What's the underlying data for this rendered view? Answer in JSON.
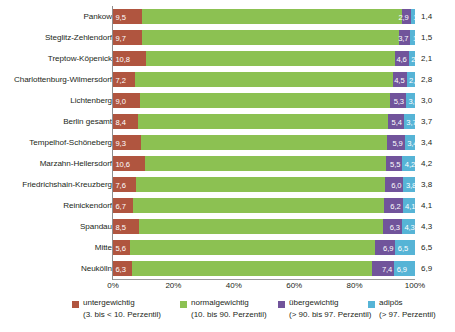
{
  "chart_data": {
    "type": "bar",
    "orientation": "horizontal",
    "stacked": true,
    "stack_mode": "percent",
    "title": "",
    "subtitle": "",
    "xlabel": "",
    "ylabel": "",
    "xlim": [
      0,
      100
    ],
    "grid": false,
    "legend_position": "bottom",
    "xticklabels": [
      "0%",
      "20%",
      "40%",
      "60%",
      "80%",
      "100%"
    ],
    "xtickvalues": [
      0,
      20,
      40,
      60,
      80,
      100
    ],
    "categories": [
      "Pankow",
      "Steglitz-Zehlendorf",
      "Treptow-Köpenick",
      "Charlottenburg-Wilmersdorf",
      "Lichtenberg",
      "Berlin gesamt",
      "Tempelhof-Schöneberg",
      "Marzahn-Hellersdorf",
      "Friedrichshain-Kreuzberg",
      "Reinickendorf",
      "Spandau",
      "Mitte",
      "Neukölln"
    ],
    "series": [
      {
        "name": "untergewichtig",
        "sublabel": "(3. bis < 10. Perzentil)",
        "color": "#b0553f",
        "values": [
          9.5,
          9.7,
          10.8,
          7.2,
          9.0,
          8.4,
          9.3,
          10.6,
          7.6,
          6.7,
          8.5,
          5.6,
          6.3
        ],
        "labels": [
          "9,5",
          "9,7",
          "10,8",
          "7,2",
          "9,0",
          "8,4",
          "9,3",
          "10,6",
          "7,6",
          "6,7",
          "8,5",
          "5,6",
          "6,3"
        ]
      },
      {
        "name": "normalgewichtig",
        "sublabel": "(10. bis 90. Perzentil)",
        "color": "#8cc152",
        "values": [
          86.2,
          85.1,
          82.5,
          85.5,
          82.7,
          82.5,
          81.4,
          79.7,
          82.6,
          83.0,
          80.9,
          81.0,
          79.4
        ],
        "labels": [
          "",
          "",
          "",
          "",
          "",
          "",
          "",
          "",
          "",
          "",
          "",
          "",
          ""
        ]
      },
      {
        "name": "übergewichtig",
        "sublabel": "(> 90. bis 97. Perzentil)",
        "color": "#71549b",
        "values": [
          2.9,
          3.7,
          4.6,
          4.5,
          5.3,
          5.4,
          5.9,
          5.5,
          6.0,
          6.2,
          6.3,
          6.9,
          7.4
        ],
        "labels": [
          "2,9",
          "3,7",
          "4,6",
          "4,5",
          "5,3",
          "5,4",
          "5,9",
          "5,5",
          "6,0",
          "6,2",
          "6,3",
          "6,9",
          "7,4"
        ]
      },
      {
        "name": "adipös",
        "sublabel": "(> 97. Perzentil)",
        "color": "#56b4d6",
        "values": [
          1.4,
          1.5,
          2.1,
          2.8,
          3.0,
          3.7,
          3.4,
          4.2,
          3.8,
          4.1,
          4.3,
          6.5,
          6.9
        ],
        "labels": [
          "1,4",
          "1,5",
          "2,1",
          "2,8",
          "3,0",
          "3,7",
          "3,4",
          "4,2",
          "3,8",
          "4,1",
          "4,3",
          "6,5",
          "6,9"
        ]
      }
    ]
  },
  "legend": {
    "items": [
      {
        "label": "untergewichtig",
        "sublabel": "(3. bis < 10. Perzentil)",
        "color": "#b0553f",
        "x": 72
      },
      {
        "label": "normalgewichtig",
        "sublabel": "(10. bis 90. Perzentil)",
        "color": "#8cc152",
        "x": 180
      },
      {
        "label": "übergewichtig",
        "sublabel": "(> 90. bis 97. Perzentil)",
        "color": "#71549b",
        "x": 278
      },
      {
        "label": "adipös",
        "sublabel": "(> 97. Perzentil)",
        "color": "#56b4d6",
        "x": 368
      }
    ]
  }
}
